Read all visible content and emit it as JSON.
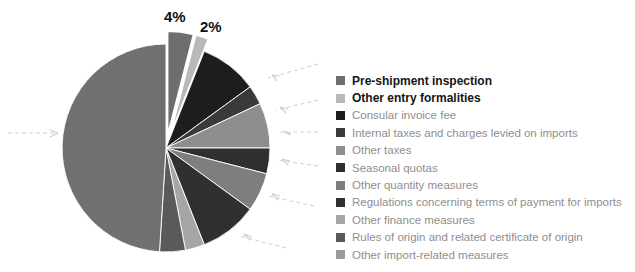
{
  "chart_data": {
    "type": "pie",
    "title": "",
    "subtitle": "",
    "xlabel": "",
    "ylabel": "",
    "grid": false,
    "legend_position": "right",
    "units": "percent",
    "total": 100,
    "categories": [
      "Pre-shipment inspection",
      "Other entry formalities",
      "Consular invoice fee",
      "Internal taxes and charges levied on imports",
      "Other taxes",
      "Seasonal quotas",
      "Other quantity measures",
      "Regulations concerning terms of payment for imports",
      "Other finance measures",
      "Rules of origin and related certificate of origin",
      "Other import-related measures"
    ],
    "values": [
      4,
      2,
      9,
      3,
      7,
      4,
      6,
      9,
      3,
      4,
      49
    ],
    "colors": [
      "#6e6e6e",
      "#b9b9b9",
      "#1d1d1d",
      "#3a3a3a",
      "#8e8e8e",
      "#2f2f2f",
      "#7e7e7e",
      "#303030",
      "#a6a6a6",
      "#5a5a5a",
      "#707070"
    ],
    "data_labels": [
      {
        "category": "Pre-shipment inspection",
        "text": "4%"
      },
      {
        "category": "Other entry formalities",
        "text": "2%"
      }
    ],
    "exploded_slices": [
      "Pre-shipment inspection",
      "Other entry formalities"
    ],
    "annotations": [
      {
        "name": "leader-arrow",
        "direction": "left"
      },
      {
        "name": "leader-arrow",
        "direction": "left"
      },
      {
        "name": "leader-arrow",
        "direction": "left"
      },
      {
        "name": "leader-arrow",
        "direction": "left"
      },
      {
        "name": "leader-arrow",
        "direction": "left"
      },
      {
        "name": "leader-arrow",
        "direction": "left"
      },
      {
        "name": "leader-arrow",
        "direction": "right"
      },
      {
        "name": "leader-arrow",
        "direction": "up"
      }
    ]
  },
  "legend": {
    "items": [
      {
        "label": "Pre-shipment inspection",
        "color": "#6e6e6e",
        "emphasis": true
      },
      {
        "label": "Other entry formalities",
        "color": "#b9b9b9",
        "emphasis": true
      },
      {
        "label": "Consular invoice fee",
        "color": "#1d1d1d",
        "emphasis": false
      },
      {
        "label": "Internal taxes and charges levied on imports",
        "color": "#3a3a3a",
        "emphasis": false
      },
      {
        "label": "Other taxes",
        "color": "#8e8e8e",
        "emphasis": false
      },
      {
        "label": "Seasonal quotas",
        "color": "#2f2f2f",
        "emphasis": false
      },
      {
        "label": "Other quantity measures",
        "color": "#7e7e7e",
        "emphasis": false
      },
      {
        "label": "Regulations concerning terms of payment for imports",
        "color": "#303030",
        "emphasis": false
      },
      {
        "label": "Other finance measures",
        "color": "#a6a6a6",
        "emphasis": false
      },
      {
        "label": "Rules of origin and related certificate of origin",
        "color": "#5a5a5a",
        "emphasis": false
      },
      {
        "label": "Other import-related measures",
        "color": "#9b9b9b",
        "emphasis": false
      }
    ]
  }
}
